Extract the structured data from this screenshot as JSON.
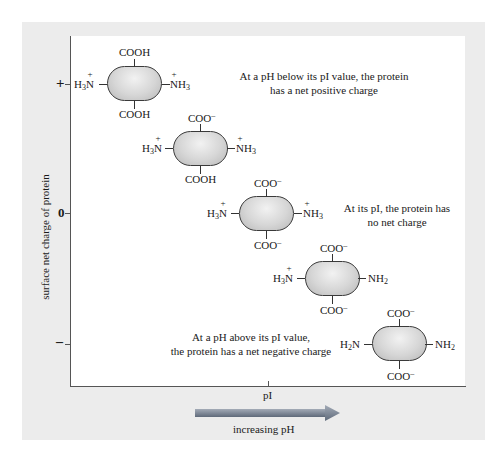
{
  "axes": {
    "y_title": "surface net charge of protein",
    "y_ticks": {
      "plus": "+",
      "zero": "0",
      "minus": "–"
    },
    "x_tick_label": "pI",
    "arrow_label": "increasing pH"
  },
  "notes": {
    "below_pi_line1": "At a pH below its pI value, the protein",
    "below_pi_line2": "has a net positive charge",
    "at_pi_line1": "At its pI, the protein has",
    "at_pi_line2": "no net charge",
    "above_pi_line1": "At a pH above its pI value,",
    "above_pi_line2": "the protein has a net negative charge"
  },
  "molecules": [
    {
      "top": "COOH",
      "bottom": "COOH",
      "left": "H3N+",
      "right": "NH3+"
    },
    {
      "top": "COO–",
      "bottom": "COOH",
      "left": "H3N+",
      "right": "NH3+"
    },
    {
      "top": "COO–",
      "bottom": "COO–",
      "left": "H3N+",
      "right": "NH3+"
    },
    {
      "top": "COO–",
      "bottom": "COO–",
      "left": "H3N+",
      "right": "NH2"
    },
    {
      "top": "COO–",
      "bottom": "COO–",
      "left": "H2N",
      "right": "NH2"
    }
  ],
  "colors": {
    "panel_bg": "#ececec",
    "plot_bg": "#ffffff",
    "arrow": "#6f7a8a",
    "protein_fill": "#d6d6d6"
  }
}
